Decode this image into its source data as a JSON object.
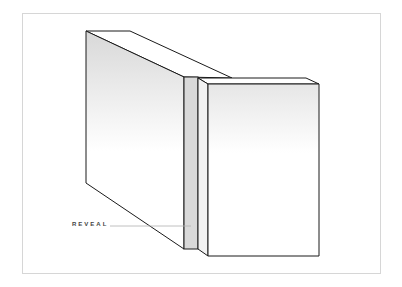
{
  "diagram": {
    "labels": [
      {
        "text": "REVEAL",
        "target": "reveal-gap"
      }
    ],
    "colors": {
      "outline": "#1a1a1a",
      "reveal_fill": "#d9d9d9",
      "frame": "#d6d6d6",
      "leader_line": "#b0b0b0",
      "gradient_top": "#dcdcdc",
      "gradient_bottom": "#ffffff"
    }
  }
}
